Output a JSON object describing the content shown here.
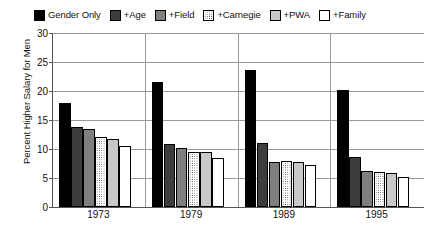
{
  "chart_data": {
    "type": "bar",
    "title": "",
    "xlabel": "",
    "ylabel": "Percent Higher Salary for Men",
    "categories": [
      "1973",
      "1979",
      "1989",
      "1995"
    ],
    "ylim": [
      0,
      30
    ],
    "yticks": [
      0,
      5,
      10,
      15,
      20,
      25,
      30
    ],
    "grid": true,
    "legend_position": "top",
    "series": [
      {
        "name": "Gender Only",
        "color": "#000000",
        "pattern": "solid",
        "values": [
          18.0,
          21.6,
          23.7,
          20.2
        ]
      },
      {
        "name": "+Age",
        "color": "#3d3d3d",
        "pattern": "solid",
        "values": [
          13.8,
          10.9,
          11.1,
          8.6
        ]
      },
      {
        "name": "+Field",
        "color": "#7f7f7f",
        "pattern": "solid",
        "values": [
          13.4,
          10.2,
          7.8,
          6.2
        ]
      },
      {
        "name": "+Carnegie",
        "color": "#ffffff",
        "pattern": "dotted",
        "values": [
          12.1,
          9.4,
          7.9,
          6.0
        ]
      },
      {
        "name": "+PWA",
        "color": "#c8c8c8",
        "pattern": "solid",
        "values": [
          11.8,
          9.4,
          7.8,
          5.9
        ]
      },
      {
        "name": "+Family",
        "color": "#ffffff",
        "pattern": "solid",
        "values": [
          10.6,
          8.4,
          7.2,
          5.1
        ]
      }
    ]
  },
  "caption": ""
}
